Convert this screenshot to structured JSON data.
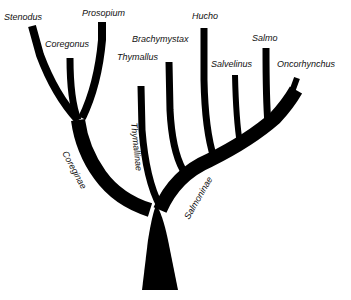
{
  "diagram": {
    "type": "phylogenetic-tree",
    "colors": {
      "branch": "#000000",
      "text": "#111111",
      "background": "#ffffff"
    },
    "genera": [
      {
        "name": "Stenodus",
        "x": 4,
        "y": 20
      },
      {
        "name": "Prosopium",
        "x": 82,
        "y": 16
      },
      {
        "name": "Coregonus",
        "x": 45,
        "y": 47
      },
      {
        "name": "Thymallus",
        "x": 117,
        "y": 60
      },
      {
        "name": "Brachymystax",
        "x": 132,
        "y": 42
      },
      {
        "name": "Hucho",
        "x": 192,
        "y": 19
      },
      {
        "name": "Salvelinus",
        "x": 211,
        "y": 67
      },
      {
        "name": "Salmo",
        "x": 252,
        "y": 41
      },
      {
        "name": "Oncorhynchus",
        "x": 277,
        "y": 67
      }
    ],
    "subfamilies": [
      {
        "name": "Coreginae",
        "x": 62,
        "y": 153,
        "rotate": 62
      },
      {
        "name": "Thymallinae",
        "x": 131,
        "y": 123,
        "rotate": 84
      },
      {
        "name": "Salmoninae",
        "x": 189,
        "y": 220,
        "rotate": -60
      }
    ]
  }
}
